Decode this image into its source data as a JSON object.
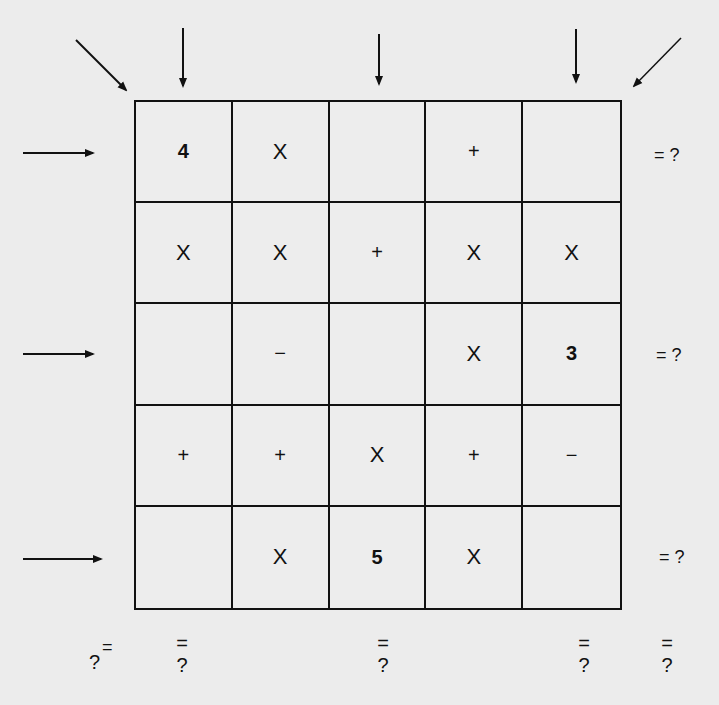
{
  "puzzle": {
    "grid": [
      [
        "4",
        "X",
        "",
        "+",
        ""
      ],
      [
        "X",
        "X",
        "+",
        "X",
        "X"
      ],
      [
        "",
        "−",
        "",
        "X",
        "3"
      ],
      [
        "+",
        "+",
        "X",
        "+",
        "−"
      ],
      [
        "",
        "X",
        "5",
        "X",
        ""
      ]
    ],
    "row_results": [
      {
        "row": 1,
        "label": "= ?"
      },
      {
        "row": 3,
        "label": "= ?"
      },
      {
        "row": 5,
        "label": "= ?"
      }
    ],
    "column_results": [
      {
        "col": 1,
        "eq": "=",
        "q": "?"
      },
      {
        "col": 3,
        "eq": "=",
        "q": "?"
      },
      {
        "col": 5,
        "eq": "=",
        "q": "?"
      }
    ],
    "diagonal_results": [
      {
        "name": "diagonal-top-left",
        "eq": "=",
        "q": "?"
      },
      {
        "name": "diagonal-top-right",
        "eq": "=",
        "q": "?"
      }
    ],
    "arrows": {
      "row_arrows": [
        1,
        3,
        5
      ],
      "column_arrows": [
        1,
        3,
        5
      ],
      "diagonal_arrows": [
        "top-left",
        "top-right"
      ]
    }
  }
}
